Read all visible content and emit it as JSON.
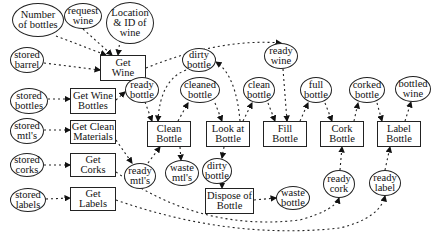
{
  "processes": [
    {
      "id": "get_wine",
      "label": "Get\nWine",
      "x": 100,
      "y": 55,
      "w": 46,
      "h": 26
    },
    {
      "id": "get_wine_bottles",
      "label": "Get Wine\nBottles",
      "x": 70,
      "y": 88,
      "w": 46,
      "h": 26
    },
    {
      "id": "get_clean_materials",
      "label": "Get Clean\nMaterials",
      "x": 70,
      "y": 120,
      "w": 46,
      "h": 24
    },
    {
      "id": "get_corks",
      "label": "Get\nCorks",
      "x": 70,
      "y": 153,
      "w": 46,
      "h": 24
    },
    {
      "id": "get_labels",
      "label": "Get\nLabels",
      "x": 70,
      "y": 187,
      "w": 46,
      "h": 24
    },
    {
      "id": "clean_bottle",
      "label": "Clean\nBottle",
      "x": 147,
      "y": 121,
      "w": 44,
      "h": 26
    },
    {
      "id": "look_at_bottle",
      "label": "Look at\nBottle",
      "x": 206,
      "y": 121,
      "w": 44,
      "h": 26
    },
    {
      "id": "fill_bottle",
      "label": "Fill\nBottle",
      "x": 263,
      "y": 121,
      "w": 44,
      "h": 26
    },
    {
      "id": "cork_bottle",
      "label": "Cork\nBottle",
      "x": 320,
      "y": 121,
      "w": 44,
      "h": 26
    },
    {
      "id": "label_bottle",
      "label": "Label\nBottle",
      "x": 377,
      "y": 121,
      "w": 44,
      "h": 26
    },
    {
      "id": "dispose_of_bottle",
      "label": "Dispose of\nBottle",
      "x": 205,
      "y": 188,
      "w": 49,
      "h": 26
    }
  ],
  "data_stores": [
    {
      "id": "number_of_bottles",
      "label": "Number\nof bottles",
      "x": 12,
      "y": 3,
      "w": 52,
      "h": 34
    },
    {
      "id": "request_wine",
      "label": "request\nwine",
      "x": 64,
      "y": 3,
      "w": 38,
      "h": 26
    },
    {
      "id": "location_id_wine",
      "label": "Location\n& ID of\nwine",
      "x": 106,
      "y": 2,
      "w": 48,
      "h": 42
    },
    {
      "id": "stored_barrel",
      "label": "stored\nbarrel",
      "x": 10,
      "y": 47,
      "w": 34,
      "h": 26
    },
    {
      "id": "stored_bottles",
      "label": "stored\nbottles",
      "x": 10,
      "y": 88,
      "w": 38,
      "h": 26
    },
    {
      "id": "stored_mtls",
      "label": "stored\nmtl's",
      "x": 10,
      "y": 118,
      "w": 34,
      "h": 26
    },
    {
      "id": "stored_corks",
      "label": "stored\ncorks",
      "x": 10,
      "y": 153,
      "w": 34,
      "h": 24
    },
    {
      "id": "stored_labels",
      "label": "stored\nlabels",
      "x": 10,
      "y": 188,
      "w": 36,
      "h": 24
    },
    {
      "id": "ready_bottle",
      "label": "ready\nbottle",
      "x": 125,
      "y": 77,
      "w": 34,
      "h": 26
    },
    {
      "id": "dirty_bottle_top",
      "label": "dirty\nbottle",
      "x": 182,
      "y": 48,
      "w": 34,
      "h": 24
    },
    {
      "id": "cleaned_bottle",
      "label": "cleaned\nbottle",
      "x": 180,
      "y": 77,
      "w": 40,
      "h": 26
    },
    {
      "id": "ready_wine",
      "label": "ready\nwine",
      "x": 264,
      "y": 43,
      "w": 34,
      "h": 26
    },
    {
      "id": "clean_bottle_data",
      "label": "clean\nbottle",
      "x": 243,
      "y": 77,
      "w": 32,
      "h": 26
    },
    {
      "id": "full_bottle",
      "label": "full\nbottle",
      "x": 300,
      "y": 77,
      "w": 32,
      "h": 26
    },
    {
      "id": "corked_bottle",
      "label": "corked\nbottle",
      "x": 349,
      "y": 77,
      "w": 36,
      "h": 26
    },
    {
      "id": "bottled_wine",
      "label": "bottled\nwine",
      "x": 395,
      "y": 76,
      "w": 36,
      "h": 26
    },
    {
      "id": "ready_mtls",
      "label": "ready\nmtl's",
      "x": 124,
      "y": 163,
      "w": 32,
      "h": 26
    },
    {
      "id": "waste_mtls",
      "label": "waste\nmtl's",
      "x": 165,
      "y": 160,
      "w": 34,
      "h": 26
    },
    {
      "id": "dirty_bottle_mid",
      "label": "dirty\nbottle",
      "x": 202,
      "y": 158,
      "w": 30,
      "h": 26
    },
    {
      "id": "waste_bottle",
      "label": "waste\nbottle",
      "x": 276,
      "y": 186,
      "w": 34,
      "h": 24
    },
    {
      "id": "ready_cork",
      "label": "ready\ncork",
      "x": 323,
      "y": 170,
      "w": 32,
      "h": 28
    },
    {
      "id": "ready_label",
      "label": "ready\nlabel",
      "x": 369,
      "y": 170,
      "w": 32,
      "h": 26
    }
  ]
}
